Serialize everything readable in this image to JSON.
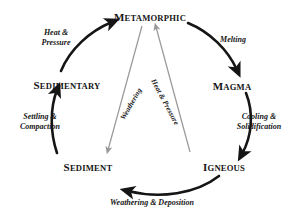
{
  "diagram": {
    "background_color": "#ffffff",
    "ink_color": "#151515",
    "faint_arrow_color": "#9a9a9a",
    "nodes": [
      {
        "id": "metamorphic",
        "label": "Metamorphic",
        "initial": "M",
        "rest": "ETAMORPHIC"
      },
      {
        "id": "magma",
        "label": "Magma",
        "initial": "M",
        "rest": "AGMA"
      },
      {
        "id": "igneous",
        "label": "Igneous",
        "initial": "I",
        "rest": "GNEOUS"
      },
      {
        "id": "sediment",
        "label": "Sediment",
        "initial": "S",
        "rest": "EDIMENT"
      },
      {
        "id": "sedimentary",
        "label": "Sedimentary",
        "initial": "S",
        "rest": "EDIMENTARY"
      }
    ],
    "edges": [
      {
        "id": "metamorphic-to-magma",
        "label": "Melting",
        "from": "metamorphic",
        "to": "magma"
      },
      {
        "id": "magma-to-igneous",
        "label_line1": "Cooling &",
        "label_line2": "Solidification",
        "from": "magma",
        "to": "igneous"
      },
      {
        "id": "igneous-to-sediment",
        "label": "Weathering & Deposition",
        "from": "igneous",
        "to": "sediment"
      },
      {
        "id": "sediment-to-sedimentary",
        "label_line1": "Settling &",
        "label_line2": "Compaction",
        "from": "sediment",
        "to": "sedimentary"
      },
      {
        "id": "sedimentary-to-metamorphic",
        "label_line1": "Heat &",
        "label_line2": "Pressure",
        "from": "sedimentary",
        "to": "metamorphic"
      },
      {
        "id": "metamorphic-to-sediment",
        "label": "Weathering",
        "from": "metamorphic",
        "to": "sediment"
      },
      {
        "id": "igneous-to-metamorphic",
        "label": "Heat & Pressure",
        "from": "igneous",
        "to": "metamorphic"
      }
    ]
  }
}
